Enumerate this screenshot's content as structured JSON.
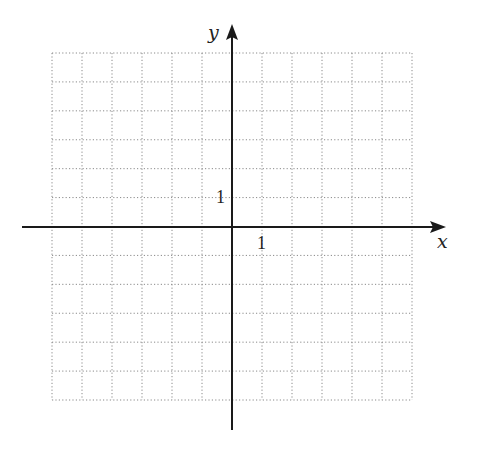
{
  "diagram": {
    "type": "coordinate-grid",
    "axes": {
      "x_label": "x",
      "y_label": "y",
      "x_tick_label": "1",
      "y_tick_label": "1"
    },
    "grid": {
      "columns": 12,
      "rows": 12,
      "x_range": [
        -6,
        6
      ],
      "y_range": [
        -6,
        6
      ],
      "style": "dotted"
    },
    "colors": {
      "axis": "#1a1a1a",
      "grid": "#8a8a8a",
      "text": "#222222"
    }
  }
}
